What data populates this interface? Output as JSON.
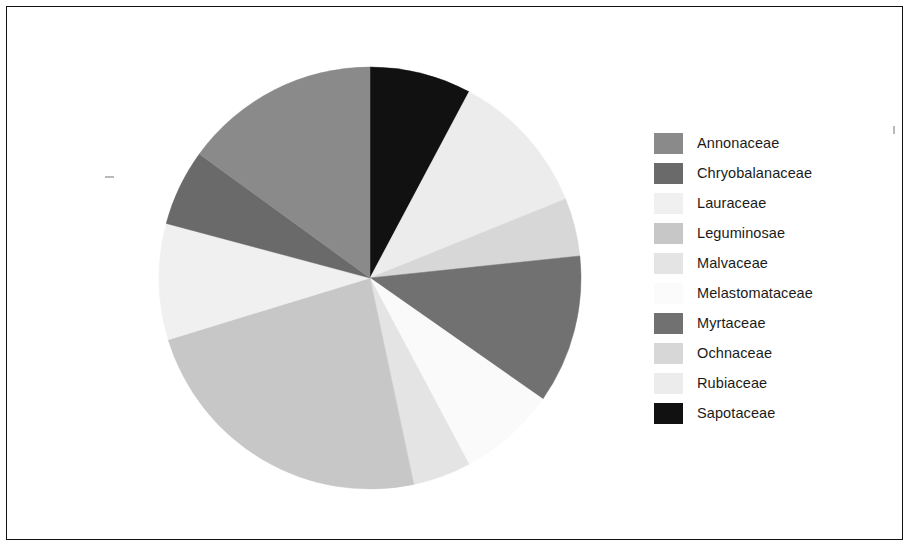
{
  "figure": {
    "background_color": "#ffffff",
    "frame_color": "#111111",
    "text_color": "#1b1b1b"
  },
  "legend": {
    "title": "",
    "position": "right",
    "entries": [
      {
        "label": "Annonaceae",
        "color": "#8a8a8a"
      },
      {
        "label": "Chryobalanaceae",
        "color": "#6a6a6a"
      },
      {
        "label": "Lauraceae",
        "color": "#f0f0f0"
      },
      {
        "label": "Leguminosae",
        "color": "#c7c7c7"
      },
      {
        "label": "Malvaceae",
        "color": "#e4e4e4"
      },
      {
        "label": "Melastomataceae",
        "color": "#fafafa"
      },
      {
        "label": "Myrtaceae",
        "color": "#717171"
      },
      {
        "label": "Ochnaceae",
        "color": "#d7d7d7"
      },
      {
        "label": "Rubiaceae",
        "color": "#ececec"
      },
      {
        "label": "Sapotaceae",
        "color": "#111111"
      }
    ]
  },
  "chart_data": {
    "type": "pie",
    "title": "",
    "xlabel": "",
    "ylabel": "",
    "start_angle_deg": 0,
    "direction": "clockwise",
    "center": {
      "x": 370,
      "y": 278
    },
    "radius": 211,
    "categories": [
      "Sapotaceae",
      "Rubiaceae",
      "Ochnaceae",
      "Myrtaceae",
      "Melastomataceae",
      "Malvaceae",
      "Leguminosae",
      "Lauraceae",
      "Chryobalanaceae",
      "Annonaceae"
    ],
    "values": [
      7.8,
      11.1,
      4.4,
      11.4,
      7.5,
      4.4,
      23.6,
      8.9,
      5.8,
      15.1
    ],
    "angles_deg": [
      28,
      40,
      16,
      41,
      27,
      16,
      85,
      32,
      21,
      54
    ],
    "colors": [
      "#111111",
      "#ececec",
      "#d7d7d7",
      "#717171",
      "#fafafa",
      "#e4e4e4",
      "#c7c7c7",
      "#f0f0f0",
      "#6a6a6a",
      "#8a8a8a"
    ],
    "slices": [
      {
        "label": "Sapotaceae",
        "value": 7.8,
        "angle_deg": 28,
        "start_deg": 0,
        "end_deg": 28,
        "color": "#111111"
      },
      {
        "label": "Rubiaceae",
        "value": 11.1,
        "angle_deg": 40,
        "start_deg": 28,
        "end_deg": 68,
        "color": "#ececec"
      },
      {
        "label": "Ochnaceae",
        "value": 4.4,
        "angle_deg": 16,
        "start_deg": 68,
        "end_deg": 84,
        "color": "#d7d7d7"
      },
      {
        "label": "Myrtaceae",
        "value": 11.4,
        "angle_deg": 41,
        "start_deg": 84,
        "end_deg": 125,
        "color": "#717171"
      },
      {
        "label": "Melastomataceae",
        "value": 7.5,
        "angle_deg": 27,
        "start_deg": 125,
        "end_deg": 152,
        "color": "#fafafa"
      },
      {
        "label": "Malvaceae",
        "value": 4.4,
        "angle_deg": 16,
        "start_deg": 152,
        "end_deg": 168,
        "color": "#e4e4e4"
      },
      {
        "label": "Leguminosae",
        "value": 23.6,
        "angle_deg": 85,
        "start_deg": 168,
        "end_deg": 253,
        "color": "#c7c7c7"
      },
      {
        "label": "Lauraceae",
        "value": 8.9,
        "angle_deg": 32,
        "start_deg": 253,
        "end_deg": 285,
        "color": "#f0f0f0"
      },
      {
        "label": "Chryobalanaceae",
        "value": 5.8,
        "angle_deg": 21,
        "start_deg": 285,
        "end_deg": 306,
        "color": "#6a6a6a"
      },
      {
        "label": "Annonaceae",
        "value": 15.1,
        "angle_deg": 54,
        "start_deg": 306,
        "end_deg": 360,
        "color": "#8a8a8a"
      }
    ]
  }
}
